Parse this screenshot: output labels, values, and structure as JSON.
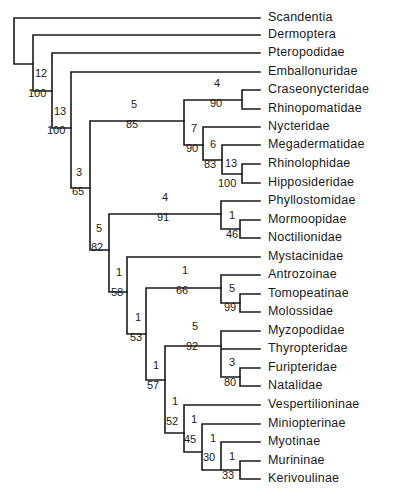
{
  "chart_data": {
    "type": "cladogram",
    "title": "",
    "taxa": [
      "Scandentia",
      "Dermoptera",
      "Pteropodidae",
      "Emballonuridae",
      "Craseonycteridae",
      "Rhinopomatidae",
      "Nycteridae",
      "Megadermatidae",
      "Rhinolophidae",
      "Hipposideridae",
      "Phyllostomidae",
      "Mormoopidae",
      "Noctilionidae",
      "Mystacinidae",
      "Antrozoinae",
      "Tomopeatinae",
      "Molossidae",
      "Myzopodidae",
      "Thyropteridae",
      "Furipteridae",
      "Natalidae",
      "Vespertilioninae",
      "Miniopterinae",
      "Myotinae",
      "Murininae",
      "Kerivoulinae"
    ],
    "newick": "(Scandentia,(Dermoptera,(Pteropodidae,(Emballonuridae,(((Craseonycteridae,Rhinopomatidae)4:90,(Nycteridae,(Megadermatidae,(Rhinolophidae,Hipposideridae)13:100)6:83)7:90)5:85,((Phyllostomidae,(Mormoopidae,Noctilionidae)1:46)4:91,(Mystacinidae,((Antrozoinae,(Tomopeatinae,Molossidae)5:99)1:66,((Myzopodidae,Thyropteridae,(Furipteridae,Natalidae)3:80)5:92,(Vespertilioninae,(Miniopterinae,(Myotinae,(Murininae,Kerivoulinae)1:33)1:30)1:45)1:52)1:57)1:53)1:58)5:82)3:65)13:100)12:100)",
    "node_labels": [
      {
        "decay": "12",
        "bootstrap": "100",
        "clade": "Dermoptera+Chiroptera"
      },
      {
        "decay": "13",
        "bootstrap": "100",
        "clade": "Chiroptera"
      },
      {
        "decay": "3",
        "bootstrap": "65",
        "clade": "Microchiroptera"
      },
      {
        "decay": "5",
        "bootstrap": "85",
        "clade": "Rhinopomatoidea+Rhinolophoidea"
      },
      {
        "decay": "4",
        "bootstrap": "90",
        "clade": "Craseonycteridae+Rhinopomatidae"
      },
      {
        "decay": "7",
        "bootstrap": "90",
        "clade": "Nycteridae+Megadermatidae+Rhinolophidae+Hipposideridae"
      },
      {
        "decay": "6",
        "bootstrap": "83",
        "clade": "Megadermatidae+Rhinolophidae+Hipposideridae"
      },
      {
        "decay": "13",
        "bootstrap": "100",
        "clade": "Rhinolophidae+Hipposideridae"
      },
      {
        "decay": "5",
        "bootstrap": "82",
        "clade": "Noctilionoidea+Vespertilionoidea"
      },
      {
        "decay": "4",
        "bootstrap": "91",
        "clade": "Phyllostomidae+Mormoopidae+Noctilionidae"
      },
      {
        "decay": "1",
        "bootstrap": "46",
        "clade": "Mormoopidae+Noctilionidae"
      },
      {
        "decay": "1",
        "bootstrap": "58",
        "clade": "Mystacinidae+rest"
      },
      {
        "decay": "1",
        "bootstrap": "53",
        "clade": "Antrozoinae..Kerivoulinae"
      },
      {
        "decay": "1",
        "bootstrap": "66",
        "clade": "Antrozoinae+Tomopeatinae+Molossidae"
      },
      {
        "decay": "5",
        "bootstrap": "99",
        "clade": "Tomopeatinae+Molossidae"
      },
      {
        "decay": "1",
        "bootstrap": "57",
        "clade": "Myzopodidae..Kerivoulinae"
      },
      {
        "decay": "5",
        "bootstrap": "92",
        "clade": "Myzopodidae+Thyropteridae+Furipteridae+Natalidae"
      },
      {
        "decay": "3",
        "bootstrap": "80",
        "clade": "Furipteridae+Natalidae"
      },
      {
        "decay": "1",
        "bootstrap": "52",
        "clade": "Vespertilionidae"
      },
      {
        "decay": "1",
        "bootstrap": "45",
        "clade": "Miniopterinae+Myotinae+Murininae+Kerivoulinae"
      },
      {
        "decay": "1",
        "bootstrap": "30",
        "clade": "Myotinae+Murininae+Kerivoulinae"
      },
      {
        "decay": "1",
        "bootstrap": "33",
        "clade": "Murininae+Kerivoulinae"
      }
    ],
    "legend": "Numbers above branches: decay index; below branches: bootstrap %"
  },
  "tree": {
    "leaves": [
      {
        "label": "Scandentia",
        "y": 18
      },
      {
        "label": "Dermoptera",
        "y": 35
      },
      {
        "label": "Pteropodidae",
        "y": 53
      },
      {
        "label": "Emballonuridae",
        "y": 72
      },
      {
        "label": "Craseonycteridae",
        "y": 90
      },
      {
        "label": "Rhinopomatidae",
        "y": 109
      },
      {
        "label": "Nycteridae",
        "y": 127
      },
      {
        "label": "Megadermatidae",
        "y": 145
      },
      {
        "label": "Rhinolophidae",
        "y": 164
      },
      {
        "label": "Hipposideridae",
        "y": 183
      },
      {
        "label": "Phyllostomidae",
        "y": 201
      },
      {
        "label": "Mormoopidae",
        "y": 220
      },
      {
        "label": "Noctilionidae",
        "y": 238
      },
      {
        "label": "Mystacinidae",
        "y": 257
      },
      {
        "label": "Antrozoinae",
        "y": 275
      },
      {
        "label": "Tomopeatinae",
        "y": 294
      },
      {
        "label": "Molossidae",
        "y": 312
      },
      {
        "label": "Myzopodidae",
        "y": 331
      },
      {
        "label": "Thyropteridae",
        "y": 349
      },
      {
        "label": "Furipteridae",
        "y": 368
      },
      {
        "label": "Natalidae",
        "y": 386
      },
      {
        "label": "Vespertilioninae",
        "y": 405
      },
      {
        "label": "Miniopterinae",
        "y": 424
      },
      {
        "label": "Myotinae",
        "y": 442
      },
      {
        "label": "Murininae",
        "y": 461
      },
      {
        "label": "Kerivoulinae",
        "y": 479
      }
    ],
    "numbers": [
      {
        "t": "12",
        "x": 35,
        "y": 77
      },
      {
        "t": "100",
        "x": 28,
        "y": 97
      },
      {
        "t": "13",
        "x": 54,
        "y": 115
      },
      {
        "t": "100",
        "x": 47,
        "y": 134
      },
      {
        "t": "3",
        "x": 76,
        "y": 176
      },
      {
        "t": "65",
        "x": 72,
        "y": 195
      },
      {
        "t": "5",
        "x": 131,
        "y": 108
      },
      {
        "t": "85",
        "x": 126,
        "y": 128
      },
      {
        "t": "4",
        "x": 214,
        "y": 87
      },
      {
        "t": "90",
        "x": 210,
        "y": 107
      },
      {
        "t": "7",
        "x": 191,
        "y": 132
      },
      {
        "t": "90",
        "x": 186,
        "y": 152
      },
      {
        "t": "6",
        "x": 210,
        "y": 148
      },
      {
        "t": "83",
        "x": 204,
        "y": 168
      },
      {
        "t": "13",
        "x": 225,
        "y": 167
      },
      {
        "t": "100",
        "x": 218,
        "y": 187
      },
      {
        "t": "4",
        "x": 162,
        "y": 201
      },
      {
        "t": "91",
        "x": 157,
        "y": 221
      },
      {
        "t": "1",
        "x": 229,
        "y": 219
      },
      {
        "t": "46",
        "x": 226,
        "y": 238
      },
      {
        "t": "5",
        "x": 96,
        "y": 232
      },
      {
        "t": "82",
        "x": 91,
        "y": 251
      },
      {
        "t": "1",
        "x": 116,
        "y": 276
      },
      {
        "t": "58",
        "x": 111,
        "y": 296
      },
      {
        "t": "1",
        "x": 182,
        "y": 274
      },
      {
        "t": "66",
        "x": 176,
        "y": 294
      },
      {
        "t": "5",
        "x": 229,
        "y": 292
      },
      {
        "t": "99",
        "x": 224,
        "y": 311
      },
      {
        "t": "1",
        "x": 135,
        "y": 321
      },
      {
        "t": "53",
        "x": 130,
        "y": 341
      },
      {
        "t": "5",
        "x": 192,
        "y": 330
      },
      {
        "t": "92",
        "x": 186,
        "y": 350
      },
      {
        "t": "1",
        "x": 153,
        "y": 369
      },
      {
        "t": "57",
        "x": 147,
        "y": 389
      },
      {
        "t": "3",
        "x": 229,
        "y": 366
      },
      {
        "t": "80",
        "x": 224,
        "y": 386
      },
      {
        "t": "1",
        "x": 172,
        "y": 405
      },
      {
        "t": "52",
        "x": 166,
        "y": 425
      },
      {
        "t": "1",
        "x": 191,
        "y": 423
      },
      {
        "t": "45",
        "x": 184,
        "y": 443
      },
      {
        "t": "1",
        "x": 210,
        "y": 442
      },
      {
        "t": "30",
        "x": 203,
        "y": 461
      },
      {
        "t": "1",
        "x": 229,
        "y": 460
      },
      {
        "t": "33",
        "x": 222,
        "y": 479
      }
    ]
  }
}
